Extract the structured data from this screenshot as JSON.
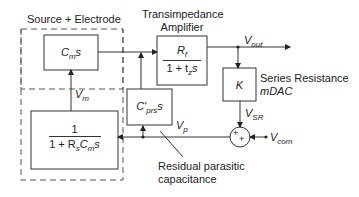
{
  "groups": {
    "source_electrode": "Source + Electrode",
    "amplifier_line1": "Transimpedance",
    "amplifier_line2": "Amplifier",
    "series_resistance_line1": "Series Resistance",
    "series_resistance_line2": "mDAC",
    "residual_line1": "Residual parasitic",
    "residual_line2": "capacitance"
  },
  "blocks": {
    "cm": {
      "main": "C",
      "sub": "m",
      "tail": "s"
    },
    "rf": {
      "num_main": "R",
      "num_sub": "f",
      "den_pre": "1 + t",
      "den_sub": "z",
      "den_tail": "s"
    },
    "k": {
      "label": "K"
    },
    "cprs": {
      "main": "C'",
      "sub": "prs",
      "tail": "s"
    },
    "source": {
      "num": "1",
      "den_pre": "1 + R",
      "den_sub1": "s",
      "den_mid": "C",
      "den_sub2": "m",
      "den_tail": "s"
    }
  },
  "signals": {
    "vm": {
      "main": "V",
      "sub": "m"
    },
    "vout": {
      "main": "V",
      "sub": "out"
    },
    "vsr": {
      "main": "V",
      "sub": "SR"
    },
    "vp": {
      "main": "V",
      "sub": "p"
    },
    "vcom": {
      "main": "V",
      "sub": "com"
    }
  },
  "summer": {
    "plus1": "+",
    "plus2": "+"
  }
}
